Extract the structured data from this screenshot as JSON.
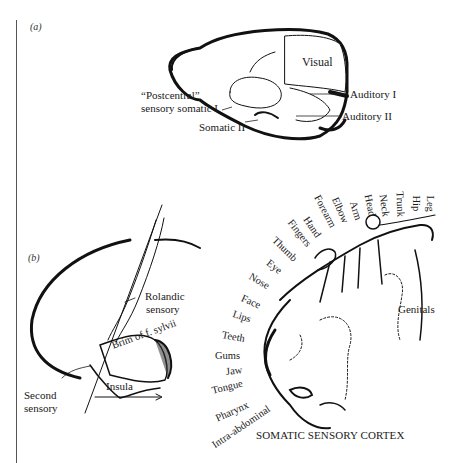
{
  "figure": {
    "panel_a": {
      "tag": "(a)",
      "labels": {
        "visual": "Visual",
        "auditory_1": "Auditory I",
        "auditory_2": "Auditory II",
        "postcentral_line1": "“Postcentral”",
        "postcentral_line2": "sensory somatic I",
        "somatic_2": "Somatic II"
      }
    },
    "panel_b": {
      "tag": "(b)",
      "labels": {
        "rolandic_line1": "Rolandic",
        "rolandic_line2": "sensory",
        "brim": "Brim of f. sylvii",
        "insula": "Insula",
        "second_line1": "Second",
        "second_line2": "sensory"
      }
    },
    "homunculus": {
      "body_parts": [
        "Leg",
        "Hip",
        "Trunk",
        "Neck",
        "Head",
        "Arm",
        "Elbow",
        "Forearm",
        "Hand",
        "Fingers",
        "Thumb",
        "Eye",
        "Nose",
        "Face",
        "Lips",
        "Teeth",
        "Gums",
        "Jaw",
        "Tongue",
        "Pharynx",
        "Intra-abdominal"
      ],
      "genitals": "Genitals",
      "caption": "SOMATIC SENSORY CORTEX"
    }
  }
}
